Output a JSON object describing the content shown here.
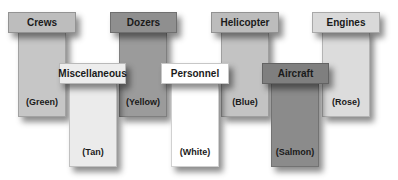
{
  "diagram": {
    "back_row": [
      {
        "id": "crews",
        "label": "Crews",
        "color_name": "(Green)",
        "header_fill": "#bdbdbd",
        "stem_fill": "#c6c6c6"
      },
      {
        "id": "dozers",
        "label": "Dozers",
        "color_name": "(Yellow)",
        "header_fill": "#8f8f8f",
        "stem_fill": "#9b9b9b"
      },
      {
        "id": "helicopter",
        "label": "Helicopter",
        "color_name": "(Blue)",
        "header_fill": "#bcbcbc",
        "stem_fill": "#c3c3c3"
      },
      {
        "id": "engines",
        "label": "Engines",
        "color_name": "(Rose)",
        "header_fill": "#d9d9d9",
        "stem_fill": "#dcdcdc"
      }
    ],
    "front_row": [
      {
        "id": "miscellaneous",
        "label": "Miscellaneous",
        "color_name": "(Tan)",
        "header_fill": "#ededed",
        "stem_fill": "#ebebeb"
      },
      {
        "id": "personnel",
        "label": "Personnel",
        "color_name": "(White)",
        "header_fill": "#ffffff",
        "stem_fill": "#ffffff"
      },
      {
        "id": "aircraft",
        "label": "Aircraft",
        "color_name": "(Salmon)",
        "header_fill": "#7f7f7f",
        "stem_fill": "#8b8b8b"
      }
    ]
  }
}
